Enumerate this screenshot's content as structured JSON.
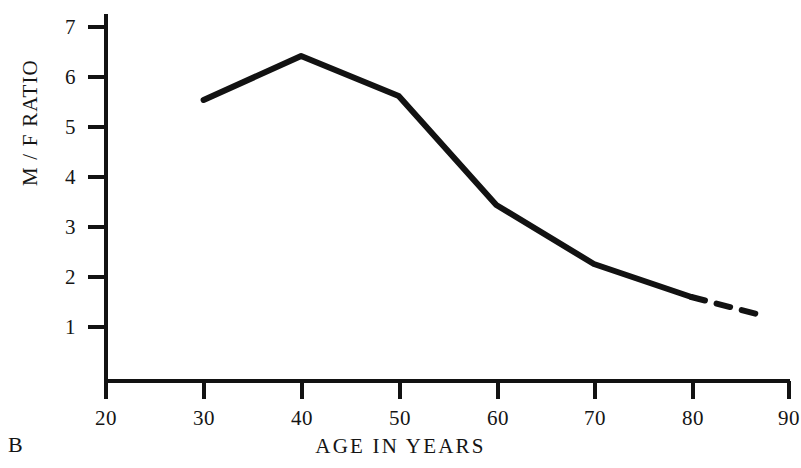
{
  "figure": {
    "panel_label": "B",
    "background_color": "#ffffff",
    "ink_color": "#121212"
  },
  "chart_data": {
    "type": "line",
    "title": "",
    "subtitle": "",
    "xlabel": "AGE IN YEARS",
    "ylabel": "M / F RATIO",
    "xlim": [
      20,
      90
    ],
    "ylim": [
      0,
      7.4
    ],
    "xticks": [
      20,
      30,
      40,
      50,
      60,
      70,
      80,
      90
    ],
    "xtick_labels": [
      "20",
      "30",
      "40",
      "50",
      "60",
      "70",
      "80",
      "90"
    ],
    "yticks": [
      1,
      2,
      3,
      4,
      5,
      6,
      7
    ],
    "ytick_labels": [
      "1",
      "2",
      "3",
      "4",
      "5",
      "6",
      "7"
    ],
    "grid": false,
    "legend": null,
    "annotations": [],
    "series": [
      {
        "name": "M/F ratio (observed)",
        "style": "solid",
        "color": "#121212",
        "x": [
          30,
          40,
          50,
          60,
          70,
          80
        ],
        "values": [
          5.54,
          6.42,
          5.62,
          3.44,
          2.26,
          1.6
        ]
      },
      {
        "name": "M/F ratio (extrapolated)",
        "style": "dashed",
        "color": "#121212",
        "x": [
          80,
          87.5
        ],
        "values": [
          1.6,
          1.22
        ]
      }
    ]
  }
}
